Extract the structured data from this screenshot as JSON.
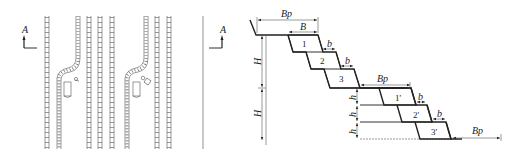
{
  "figure": {
    "plan_view": {
      "section_markers": [
        {
          "label": "A",
          "position": "left"
        },
        {
          "label": "A",
          "position": "right"
        }
      ]
    },
    "section_view": {
      "dimensions": {
        "top_width": "Bp",
        "bench_width": "B",
        "berm_1": "b",
        "berm_2": "b",
        "height_1": "H",
        "height_2": "H",
        "right_width": "Bp",
        "bottom_width": "Bp",
        "sub_height_1": "h",
        "sub_height_2": "h",
        "sub_height_3": "h"
      },
      "upper_slices": [
        "1",
        "2",
        "3"
      ],
      "lower_slices": [
        "1'",
        "2'",
        "3'"
      ]
    }
  }
}
